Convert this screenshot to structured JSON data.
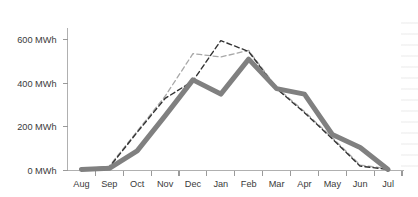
{
  "chart_data": {
    "type": "line",
    "title": "",
    "subtitle": "",
    "xlabel": "",
    "ylabel": "",
    "grid": false,
    "legend_position": "none",
    "categories": [
      "Aug",
      "Sep",
      "Oct",
      "Nov",
      "Dec",
      "Jan",
      "Feb",
      "Mar",
      "Apr",
      "May",
      "Jun",
      "Jul"
    ],
    "x_tick_labels": [
      "Aug",
      "Sep",
      "Oct",
      "Nov",
      "Dec",
      "Jan",
      "Feb",
      "Mar",
      "Apr",
      "May",
      "Jun",
      "Jul"
    ],
    "y_tick_labels": [
      "0 MWh",
      "200 MWh",
      "400 MWh",
      "600 MWh"
    ],
    "y_tick_values": [
      0,
      200,
      400,
      600
    ],
    "y_unit": "MWh",
    "ylim": [
      0,
      640
    ],
    "series": [
      {
        "name": "thick-solid-series",
        "style": "solid",
        "color": "#808080",
        "width": 5,
        "values": [
          5,
          10,
          90,
          250,
          415,
          350,
          510,
          375,
          350,
          165,
          105,
          5
        ]
      },
      {
        "name": "dark-dashed-series",
        "style": "dashed",
        "color": "#333333",
        "width": 1.4,
        "values": [
          5,
          15,
          175,
          330,
          410,
          595,
          545,
          375,
          265,
          145,
          20,
          5
        ]
      },
      {
        "name": "light-dashed-series",
        "style": "dashed",
        "color": "#a8a8a8",
        "width": 1.3,
        "values": [
          5,
          20,
          180,
          340,
          535,
          520,
          550,
          380,
          270,
          150,
          25,
          8
        ]
      }
    ]
  },
  "axes": {
    "y_axis_label": "",
    "x_axis_label": ""
  }
}
